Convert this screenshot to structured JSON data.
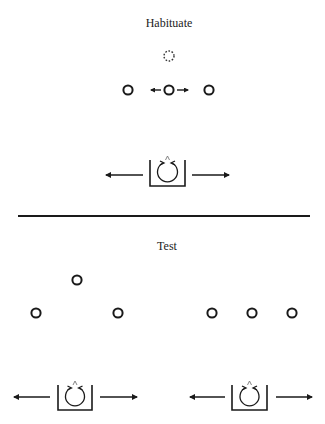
{
  "diagram": {
    "sections": [
      {
        "title": "Habituate",
        "description": "Three objects in a row; middle object moves left/right (arrows), with a dashed circle above indicating an alternate position. Agent in box with bidirectional arrows below.",
        "objects": [
          {
            "x": 128,
            "y": 90,
            "style": "solid"
          },
          {
            "x": 169,
            "y": 90,
            "style": "solid",
            "motion": "left-right"
          },
          {
            "x": 209,
            "y": 90,
            "style": "solid"
          },
          {
            "x": 169,
            "y": 56,
            "style": "dashed"
          }
        ],
        "agents": [
          {
            "box_x": 150,
            "box_y": 160,
            "box_w": 35,
            "box_h": 26,
            "arrows": "left-right"
          }
        ]
      },
      {
        "title": "Test",
        "description": "Two test configurations: left shows one object displaced upward in a triangle arrangement; right shows three objects in a straight row. Each has an agent box with bidirectional arrows.",
        "objects": [
          {
            "x": 77,
            "y": 280,
            "style": "solid"
          },
          {
            "x": 36,
            "y": 313,
            "style": "solid"
          },
          {
            "x": 118,
            "y": 313,
            "style": "solid"
          },
          {
            "x": 212,
            "y": 313,
            "style": "solid"
          },
          {
            "x": 252,
            "y": 313,
            "style": "solid"
          },
          {
            "x": 292,
            "y": 313,
            "style": "solid"
          }
        ],
        "agents": [
          {
            "box_x": 58,
            "box_y": 385,
            "box_w": 34,
            "box_h": 25,
            "arrows": "left-right"
          },
          {
            "box_x": 232,
            "box_y": 385,
            "box_w": 35,
            "box_h": 25,
            "arrows": "left-right"
          }
        ]
      }
    ],
    "colors": {
      "stroke": "#1a1a1a",
      "background": "#ffffff"
    }
  },
  "labels": {
    "habituate": "Habituate",
    "test": "Test"
  }
}
